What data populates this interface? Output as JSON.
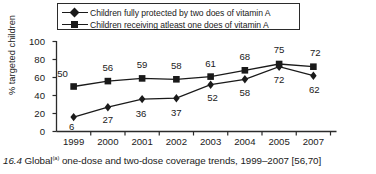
{
  "chart_data": {
    "type": "line",
    "title": "",
    "xlabel": "",
    "ylabel": "% targeted children",
    "ylim": [
      0,
      100
    ],
    "yticks": [
      0,
      20,
      40,
      60,
      80,
      100
    ],
    "grid": false,
    "legend_position": "top-inside",
    "categories": [
      "1999",
      "2000",
      "2001",
      "2002",
      "2003",
      "2004",
      "2005",
      "2007"
    ],
    "series": [
      {
        "name": "Children fully protected by two does of vitamin A",
        "marker": "diamond",
        "values": [
          6,
          27,
          36,
          37,
          52,
          58,
          72,
          62
        ],
        "plotted": [
          16,
          27,
          36,
          37,
          52,
          58,
          72,
          62
        ]
      },
      {
        "name": "Children receiving atleast one does of vitamin A",
        "marker": "square",
        "values": [
          50,
          56,
          59,
          58,
          61,
          68,
          75,
          72
        ],
        "plotted": [
          50,
          56,
          59,
          58,
          61,
          68,
          75,
          72
        ]
      }
    ]
  },
  "legend": {
    "items": [
      {
        "label": "Children fully protected by two does of vitamin A",
        "marker": "diamond-marker-icon"
      },
      {
        "label": "Children receiving atleast one does of vitamin A",
        "marker": "square-marker-icon"
      }
    ]
  },
  "caption": {
    "number": "16.4",
    "text_before": " Global",
    "superscript": "(a)",
    "text_after": " one-dose and two-dose coverage trends, 1999–2007 [56,70]"
  },
  "colors": {
    "ink": "#1a1a1a",
    "axis": "#2b2b2b",
    "background": "#ffffff"
  }
}
